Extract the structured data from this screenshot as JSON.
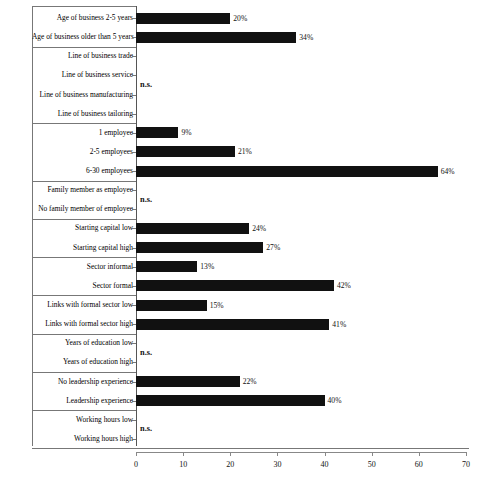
{
  "chart_data": {
    "type": "bar",
    "orientation": "horizontal",
    "title": "",
    "subtitle": "",
    "xlabel": "",
    "ylabel": "",
    "xlim": [
      0,
      70
    ],
    "xticks": [
      0,
      10,
      20,
      30,
      40,
      50,
      60,
      70
    ],
    "xtick_labels": [
      "0",
      "10",
      "20",
      "30",
      "40",
      "50",
      "60",
      "70"
    ],
    "grid": false,
    "legend": null,
    "value_suffix": "%",
    "not_significant_label": "n.s.",
    "bar_color": "#111111",
    "categories": [
      "Age of business 2-5 years",
      "Age of business older than 5 years",
      "Line of business trade",
      "Line of business service",
      "Line of business manufacturing",
      "Line of business tailoring",
      "1 employee",
      "2-5 employees",
      "6-30 employees",
      "Family member as employee",
      "No family member of employee",
      "Starting capital low",
      "Starting capital high",
      "Sector informal",
      "Sector formal",
      "Links with formal sector low",
      "Links with formal sector high",
      "Years of education low",
      "Years of education high",
      "No leadership experience",
      "Leadership experience",
      "Working hours low",
      "Working hours high"
    ],
    "values": [
      20,
      34,
      null,
      null,
      null,
      null,
      9,
      21,
      64,
      null,
      null,
      24,
      27,
      13,
      42,
      15,
      41,
      null,
      null,
      22,
      40,
      null,
      null
    ],
    "value_labels": [
      "20%",
      "34%",
      "",
      "",
      "",
      "",
      "9%",
      "21%",
      "64%",
      "",
      "",
      "24%",
      "27%",
      "13%",
      "42%",
      "15%",
      "41%",
      "",
      "",
      "22%",
      "40%",
      "",
      ""
    ],
    "groups": [
      {
        "name": "Age of business",
        "rows": [
          0,
          1
        ],
        "significant": true
      },
      {
        "name": "Line of business",
        "rows": [
          2,
          3,
          4,
          5
        ],
        "significant": false
      },
      {
        "name": "Number of employees",
        "rows": [
          6,
          7,
          8
        ],
        "significant": true
      },
      {
        "name": "Family member employment",
        "rows": [
          9,
          10
        ],
        "significant": false
      },
      {
        "name": "Starting capital",
        "rows": [
          11,
          12
        ],
        "significant": true
      },
      {
        "name": "Sector",
        "rows": [
          13,
          14
        ],
        "significant": true
      },
      {
        "name": "Links with formal sector",
        "rows": [
          15,
          16
        ],
        "significant": true
      },
      {
        "name": "Years of education",
        "rows": [
          17,
          18
        ],
        "significant": false
      },
      {
        "name": "Leadership experience",
        "rows": [
          19,
          20
        ],
        "significant": true
      },
      {
        "name": "Working hours",
        "rows": [
          21,
          22
        ],
        "significant": false
      }
    ],
    "ns_groups": [
      "Line of business",
      "Family member employment",
      "Years of education",
      "Working hours"
    ]
  }
}
